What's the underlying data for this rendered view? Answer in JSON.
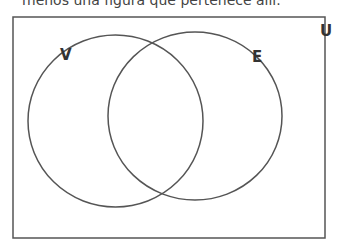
{
  "caption": "menos una figura que pertenece allí.",
  "diagram": {
    "type": "venn",
    "universe_label": "U",
    "sets": [
      {
        "label": "V",
        "position": "left"
      },
      {
        "label": "E",
        "position": "right"
      }
    ],
    "colors": {
      "stroke": "#555555",
      "label": "#333333",
      "background": "#ffffff"
    }
  }
}
